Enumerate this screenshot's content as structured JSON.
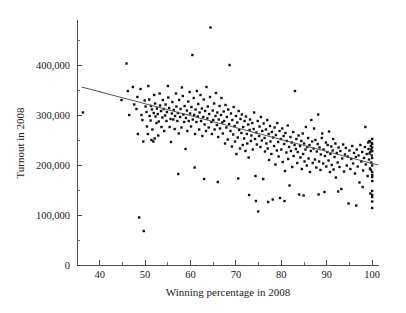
{
  "chart_data": {
    "type": "scatter",
    "title": "",
    "xlabel": "Winning percentage in 2008",
    "ylabel": "Turnout in 2008",
    "xlim": [
      35,
      101.5
    ],
    "ylim": [
      0,
      490000
    ],
    "grid": false,
    "legend": null,
    "x_ticks_major": [
      40,
      50,
      60,
      70,
      80,
      90,
      100
    ],
    "x_tick_labels": [
      "40",
      "50",
      "60",
      "70",
      "80",
      "90",
      "100"
    ],
    "x_ticks_minor": [
      45,
      55,
      65,
      75,
      85,
      95
    ],
    "y_ticks_major": [
      0,
      100000,
      200000,
      300000,
      400000
    ],
    "y_tick_labels": [
      "0",
      "100,000",
      "200,000",
      "300,000",
      "400,000"
    ],
    "y_ticks_minor": [
      50000,
      150000,
      250000,
      350000,
      450000
    ],
    "point_color": "#111111",
    "point_size_px": 1.7,
    "fit_line": {
      "color": "#555555",
      "x_start": 36.0,
      "y_start": 356000,
      "x_end": 101.3,
      "y_end": 200000,
      "slope": -2390,
      "intercept": 442000
    },
    "annotations": [],
    "points": [
      [
        36.3,
        305000
      ],
      [
        44.8,
        330000
      ],
      [
        45.9,
        403000
      ],
      [
        46.2,
        348000
      ],
      [
        46.5,
        300000
      ],
      [
        47.3,
        356000
      ],
      [
        47.6,
        321000
      ],
      [
        48.1,
        312000
      ],
      [
        48.3,
        336000
      ],
      [
        48.4,
        262000
      ],
      [
        48.7,
        95000
      ],
      [
        49.0,
        352000
      ],
      [
        49.2,
        300000
      ],
      [
        49.4,
        290000
      ],
      [
        49.6,
        247000
      ],
      [
        49.7,
        68000
      ],
      [
        49.9,
        329000
      ],
      [
        50.1,
        317000
      ],
      [
        50.3,
        306000
      ],
      [
        50.4,
        277000
      ],
      [
        50.6,
        262000
      ],
      [
        50.7,
        358000
      ],
      [
        50.9,
        331000
      ],
      [
        51.0,
        298000
      ],
      [
        51.2,
        289000
      ],
      [
        51.3,
        318000
      ],
      [
        51.5,
        311000
      ],
      [
        51.6,
        271000
      ],
      [
        51.8,
        247000
      ],
      [
        51.9,
        304000
      ],
      [
        52.0,
        340000
      ],
      [
        52.2,
        323000
      ],
      [
        52.3,
        297000
      ],
      [
        52.5,
        284000
      ],
      [
        52.6,
        313000
      ],
      [
        52.8,
        302000
      ],
      [
        52.9,
        259000
      ],
      [
        53.0,
        287000
      ],
      [
        53.2,
        343000
      ],
      [
        53.3,
        319000
      ],
      [
        53.5,
        308000
      ],
      [
        53.6,
        276000
      ],
      [
        53.8,
        295000
      ],
      [
        53.9,
        330000
      ],
      [
        54.1,
        312000
      ],
      [
        54.2,
        268000
      ],
      [
        54.4,
        299000
      ],
      [
        54.5,
        321000
      ],
      [
        54.7,
        288000
      ],
      [
        54.8,
        306000
      ],
      [
        55.0,
        358000
      ],
      [
        55.1,
        335000
      ],
      [
        55.3,
        314000
      ],
      [
        55.4,
        276000
      ],
      [
        55.6,
        292000
      ],
      [
        55.7,
        246000
      ],
      [
        55.9,
        303000
      ],
      [
        56.0,
        326000
      ],
      [
        56.2,
        291000
      ],
      [
        56.3,
        310000
      ],
      [
        56.5,
        272000
      ],
      [
        56.6,
        298000
      ],
      [
        56.8,
        343000
      ],
      [
        56.9,
        317000
      ],
      [
        57.1,
        288000
      ],
      [
        57.2,
        304000
      ],
      [
        57.4,
        263000
      ],
      [
        57.5,
        330000
      ],
      [
        57.7,
        296000
      ],
      [
        57.8,
        312000
      ],
      [
        58.0,
        275000
      ],
      [
        58.1,
        355000
      ],
      [
        58.3,
        338000
      ],
      [
        58.4,
        301000
      ],
      [
        58.6,
        286000
      ],
      [
        58.7,
        318000
      ],
      [
        58.9,
        232000
      ],
      [
        59.0,
        294000
      ],
      [
        59.2,
        309000
      ],
      [
        59.3,
        268000
      ],
      [
        59.5,
        327000
      ],
      [
        59.6,
        288000
      ],
      [
        59.8,
        346000
      ],
      [
        59.9,
        303000
      ],
      [
        60.1,
        277000
      ],
      [
        60.2,
        316000
      ],
      [
        60.4,
        420000
      ],
      [
        60.5,
        291000
      ],
      [
        60.7,
        334000
      ],
      [
        60.8,
        300000
      ],
      [
        61.0,
        262000
      ],
      [
        61.1,
        311000
      ],
      [
        61.3,
        286000
      ],
      [
        61.4,
        348000
      ],
      [
        61.6,
        297000
      ],
      [
        61.7,
        322000
      ],
      [
        61.9,
        271000
      ],
      [
        62.0,
        305000
      ],
      [
        62.2,
        340000
      ],
      [
        62.3,
        288000
      ],
      [
        62.5,
        313000
      ],
      [
        62.6,
        258000
      ],
      [
        62.8,
        296000
      ],
      [
        62.9,
        331000
      ],
      [
        63.1,
        281000
      ],
      [
        63.2,
        308000
      ],
      [
        63.4,
        268000
      ],
      [
        63.5,
        356000
      ],
      [
        63.7,
        293000
      ],
      [
        63.8,
        317000
      ],
      [
        64.0,
        275000
      ],
      [
        64.1,
        302000
      ],
      [
        64.3,
        336000
      ],
      [
        64.4,
        475000
      ],
      [
        64.6,
        286000
      ],
      [
        64.7,
        262000
      ],
      [
        64.9,
        309000
      ],
      [
        65.0,
        290000
      ],
      [
        65.2,
        323000
      ],
      [
        65.3,
        271000
      ],
      [
        65.5,
        298000
      ],
      [
        65.6,
        344000
      ],
      [
        65.8,
        280000
      ],
      [
        65.9,
        305000
      ],
      [
        66.1,
        256000
      ],
      [
        66.2,
        291000
      ],
      [
        66.4,
        318000
      ],
      [
        66.5,
        273000
      ],
      [
        66.7,
        300000
      ],
      [
        66.8,
        334000
      ],
      [
        67.0,
        285000
      ],
      [
        67.1,
        263000
      ],
      [
        67.3,
        307000
      ],
      [
        67.4,
        288000
      ],
      [
        67.6,
        243000
      ],
      [
        67.7,
        320000
      ],
      [
        67.9,
        275000
      ],
      [
        68.0,
        296000
      ],
      [
        68.2,
        251000
      ],
      [
        68.3,
        311000
      ],
      [
        68.5,
        282000
      ],
      [
        68.6,
        400000
      ],
      [
        68.8,
        268000
      ],
      [
        68.9,
        303000
      ],
      [
        69.1,
        237000
      ],
      [
        69.2,
        290000
      ],
      [
        69.4,
        261000
      ],
      [
        69.5,
        316000
      ],
      [
        69.7,
        278000
      ],
      [
        69.8,
        247000
      ],
      [
        70.0,
        298000
      ],
      [
        70.1,
        222000
      ],
      [
        70.3,
        285000
      ],
      [
        70.4,
        255000
      ],
      [
        70.6,
        308000
      ],
      [
        70.7,
        270000
      ],
      [
        70.9,
        233000
      ],
      [
        71.0,
        292000
      ],
      [
        71.2,
        264000
      ],
      [
        71.3,
        301000
      ],
      [
        71.5,
        240000
      ],
      [
        71.6,
        276000
      ],
      [
        71.8,
        253000
      ],
      [
        71.9,
        288000
      ],
      [
        72.1,
        228000
      ],
      [
        72.2,
        297000
      ],
      [
        72.4,
        262000
      ],
      [
        72.5,
        243000
      ],
      [
        72.7,
        281000
      ],
      [
        72.8,
        215000
      ],
      [
        73.0,
        270000
      ],
      [
        73.1,
        291000
      ],
      [
        73.3,
        248000
      ],
      [
        73.4,
        259000
      ],
      [
        73.6,
        284000
      ],
      [
        73.7,
        231000
      ],
      [
        73.9,
        272000
      ],
      [
        74.0,
        305000
      ],
      [
        74.2,
        252000
      ],
      [
        74.3,
        178000
      ],
      [
        74.5,
        265000
      ],
      [
        74.6,
        241000
      ],
      [
        74.8,
        288000
      ],
      [
        74.9,
        107000
      ],
      [
        75.1,
        258000
      ],
      [
        75.2,
        277000
      ],
      [
        75.4,
        236000
      ],
      [
        75.5,
        296000
      ],
      [
        75.7,
        249000
      ],
      [
        75.8,
        268000
      ],
      [
        76.0,
        172000
      ],
      [
        76.1,
        283000
      ],
      [
        76.3,
        254000
      ],
      [
        76.4,
        227000
      ],
      [
        76.6,
        271000
      ],
      [
        76.7,
        243000
      ],
      [
        76.9,
        290000
      ],
      [
        77.0,
        233000
      ],
      [
        77.2,
        262000
      ],
      [
        77.3,
        210000
      ],
      [
        77.5,
        278000
      ],
      [
        77.6,
        247000
      ],
      [
        77.8,
        222000
      ],
      [
        77.9,
        266000
      ],
      [
        78.1,
        131000
      ],
      [
        78.2,
        255000
      ],
      [
        78.4,
        238000
      ],
      [
        78.5,
        275000
      ],
      [
        78.7,
        201000
      ],
      [
        78.8,
        260000
      ],
      [
        79.0,
        229000
      ],
      [
        79.1,
        284000
      ],
      [
        79.3,
        246000
      ],
      [
        79.4,
        217000
      ],
      [
        79.6,
        268000
      ],
      [
        79.7,
        134000
      ],
      [
        79.9,
        252000
      ],
      [
        80.0,
        231000
      ],
      [
        80.2,
        273000
      ],
      [
        80.3,
        206000
      ],
      [
        80.5,
        258000
      ],
      [
        80.6,
        242000
      ],
      [
        80.8,
        188000
      ],
      [
        80.9,
        264000
      ],
      [
        81.1,
        225000
      ],
      [
        81.2,
        248000
      ],
      [
        81.4,
        279000
      ],
      [
        81.5,
        212000
      ],
      [
        81.7,
        236000
      ],
      [
        81.8,
        159000
      ],
      [
        82.0,
        256000
      ],
      [
        82.1,
        228000
      ],
      [
        82.3,
        245000
      ],
      [
        82.4,
        196000
      ],
      [
        82.6,
        266000
      ],
      [
        82.7,
        218000
      ],
      [
        82.9,
        240000
      ],
      [
        83.0,
        348000
      ],
      [
        83.2,
        232000
      ],
      [
        83.3,
        252000
      ],
      [
        83.5,
        204000
      ],
      [
        83.6,
        226000
      ],
      [
        83.8,
        259000
      ],
      [
        83.9,
        141000
      ],
      [
        84.1,
        238000
      ],
      [
        84.2,
        215000
      ],
      [
        84.4,
        248000
      ],
      [
        84.5,
        192000
      ],
      [
        84.7,
        263000
      ],
      [
        84.8,
        222000
      ],
      [
        85.0,
        243000
      ],
      [
        85.1,
        207000
      ],
      [
        85.3,
        231000
      ],
      [
        85.4,
        276000
      ],
      [
        85.6,
        199000
      ],
      [
        85.7,
        236000
      ],
      [
        85.9,
        254000
      ],
      [
        86.0,
        213000
      ],
      [
        86.2,
        240000
      ],
      [
        86.3,
        186000
      ],
      [
        86.5,
        228000
      ],
      [
        86.6,
        290000
      ],
      [
        86.8,
        247000
      ],
      [
        86.9,
        204000
      ],
      [
        87.1,
        233000
      ],
      [
        87.2,
        273000
      ],
      [
        87.4,
        211000
      ],
      [
        87.5,
        250000
      ],
      [
        87.7,
        195000
      ],
      [
        87.8,
        227000
      ],
      [
        88.0,
        242000
      ],
      [
        88.1,
        301000
      ],
      [
        88.3,
        207000
      ],
      [
        88.4,
        235000
      ],
      [
        88.6,
        190000
      ],
      [
        88.7,
        221000
      ],
      [
        88.9,
        254000
      ],
      [
        89.0,
        263000
      ],
      [
        89.2,
        203000
      ],
      [
        89.3,
        231000
      ],
      [
        89.5,
        146000
      ],
      [
        89.6,
        218000
      ],
      [
        89.8,
        245000
      ],
      [
        89.9,
        197000
      ],
      [
        90.1,
        226000
      ],
      [
        90.2,
        240000
      ],
      [
        90.4,
        209000
      ],
      [
        90.5,
        267000
      ],
      [
        90.7,
        186000
      ],
      [
        90.8,
        222000
      ],
      [
        91.0,
        237000
      ],
      [
        91.1,
        200000
      ],
      [
        91.3,
        229000
      ],
      [
        91.4,
        252000
      ],
      [
        91.5,
        191000
      ],
      [
        91.7,
        216000
      ],
      [
        91.9,
        243000
      ],
      [
        92.0,
        175000
      ],
      [
        92.2,
        224000
      ],
      [
        92.4,
        205000
      ],
      [
        92.6,
        235000
      ],
      [
        92.8,
        196000
      ],
      [
        93.0,
        228000
      ],
      [
        93.2,
        152000
      ],
      [
        93.4,
        213000
      ],
      [
        93.6,
        241000
      ],
      [
        93.8,
        187000
      ],
      [
        94.0,
        221000
      ],
      [
        94.2,
        234000
      ],
      [
        94.4,
        199000
      ],
      [
        94.6,
        217000
      ],
      [
        94.8,
        123000
      ],
      [
        95.0,
        229000
      ],
      [
        95.2,
        192000
      ],
      [
        95.4,
        212000
      ],
      [
        95.6,
        238000
      ],
      [
        95.8,
        203000
      ],
      [
        96.0,
        224000
      ],
      [
        96.2,
        183000
      ],
      [
        96.4,
        216000
      ],
      [
        96.6,
        231000
      ],
      [
        96.8,
        197000
      ],
      [
        97.0,
        219000
      ],
      [
        97.2,
        165000
      ],
      [
        97.4,
        240000
      ],
      [
        97.6,
        207000
      ],
      [
        97.8,
        226000
      ],
      [
        98.0,
        189000
      ],
      [
        98.2,
        214000
      ],
      [
        98.4,
        236000
      ],
      [
        98.5,
        276000
      ],
      [
        98.6,
        201000
      ],
      [
        98.8,
        222000
      ],
      [
        99.0,
        178000
      ],
      [
        99.1,
        245000
      ],
      [
        99.2,
        232000
      ],
      [
        99.3,
        211000
      ],
      [
        99.4,
        248000
      ],
      [
        99.5,
        193000
      ],
      [
        99.6,
        226000
      ],
      [
        99.7,
        238000
      ],
      [
        99.8,
        205000
      ],
      [
        99.9,
        219000
      ],
      [
        100.0,
        242000
      ],
      [
        100.0,
        252000
      ],
      [
        100.0,
        235000
      ],
      [
        100.0,
        228000
      ],
      [
        100.0,
        214000
      ],
      [
        100.0,
        199000
      ],
      [
        100.0,
        186000
      ],
      [
        100.0,
        180000
      ],
      [
        100.0,
        176000
      ],
      [
        100.0,
        168000
      ],
      [
        100.0,
        148000
      ],
      [
        100.0,
        140000
      ],
      [
        100.0,
        136000
      ],
      [
        100.0,
        127000
      ],
      [
        100.0,
        114000
      ],
      [
        99.9,
        244000
      ],
      [
        99.8,
        231000
      ],
      [
        99.7,
        190000
      ],
      [
        99.6,
        143000
      ],
      [
        99.5,
        247000
      ],
      [
        99.4,
        223000
      ],
      [
        51.4,
        250000
      ],
      [
        52.1,
        253000
      ],
      [
        57.3,
        182000
      ],
      [
        60.9,
        195000
      ],
      [
        63.0,
        172000
      ],
      [
        66.0,
        166000
      ],
      [
        70.5,
        173000
      ],
      [
        72.9,
        140000
      ],
      [
        74.4,
        128000
      ],
      [
        77.1,
        126000
      ],
      [
        80.7,
        128000
      ],
      [
        84.9,
        139000
      ],
      [
        88.2,
        141000
      ],
      [
        92.5,
        147000
      ],
      [
        96.5,
        119000
      ],
      [
        97.9,
        156000
      ]
    ]
  },
  "figure": {
    "background_color": "#ffffff",
    "axis_color": "#4a4a4a",
    "text_color": "#1a1a1a"
  }
}
